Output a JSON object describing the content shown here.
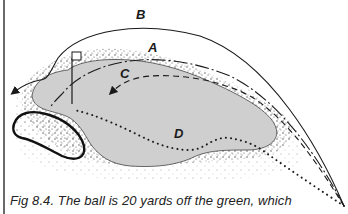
{
  "figure": {
    "caption": "Fig 8.4. The ball is 20 yards off the green, which",
    "labels": {
      "a": "A",
      "b": "B",
      "c": "C",
      "d": "D"
    },
    "elements": {
      "green": "putting green (grey fill)",
      "rough": "stippled rough around green",
      "bunker": "sand bunker left of green",
      "flag": "flag / pin on green",
      "ball_position": "lower right corner, origin of all shot paths"
    },
    "paths": [
      {
        "id": "A",
        "style": "long-dash",
        "description": "low trajectory landing near flag"
      },
      {
        "id": "B",
        "style": "solid",
        "description": "high lob arcing over the green, exits left"
      },
      {
        "id": "C",
        "style": "dashed",
        "description": "short dashed path ending with arrow on green"
      },
      {
        "id": "D",
        "style": "dotted",
        "description": "ground-level run along the green to the pin"
      }
    ],
    "colors": {
      "green_fill": "#cfcfcf",
      "ink": "#1a1a1a",
      "background": "#ffffff",
      "rule": "#6a6a6a"
    }
  }
}
